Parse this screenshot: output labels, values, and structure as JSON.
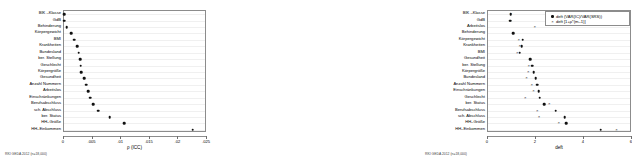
{
  "figure": {
    "source_note_left": "RKI GEDA 2012 (n=18,000)",
    "source_note_right": "RKI GEDA 2012 (n=18,000)"
  },
  "chart_data": [
    {
      "type": "scatter",
      "panel": "left",
      "title": "",
      "xlabel": "ρ (ICC)",
      "ylabel": "",
      "xlim": [
        0,
        0.025
      ],
      "xticks": [
        0,
        0.005,
        0.01,
        0.015,
        0.02,
        0.025
      ],
      "xticklabels": [
        "0",
        ".005",
        ".01",
        ".015",
        ".02",
        ".025"
      ],
      "grid": true,
      "legend": "none",
      "categories": [
        "BIK –Klasse",
        "GdB",
        "Behinderung",
        "Körpergewicht",
        "BMI",
        "Krankheiten",
        "Bundesland",
        "ber. Stellung",
        "Geschlecht",
        "Körpergröße",
        "Gesundheit",
        "Anzahl Nummern",
        "Arbeitslos",
        "Einschränkungen",
        "Berufsabschluss",
        "sch. Abschluss",
        "ber. Status",
        "HH–Größe",
        "HH–Einkommen"
      ],
      "series": [
        {
          "name": "ρ (ICC)",
          "marker": "circle",
          "values": [
            0.0,
            0.0,
            0.0005,
            0.0013,
            0.0018,
            0.0023,
            0.0026,
            0.0028,
            0.0029,
            0.003,
            0.0035,
            0.0039,
            0.0042,
            0.0046,
            0.0051,
            0.006,
            0.008,
            0.0105,
            0.0225
          ]
        }
      ]
    },
    {
      "type": "scatter",
      "panel": "right",
      "title": "",
      "xlabel": "deft",
      "ylabel": "",
      "xlim": [
        0,
        6
      ],
      "xticks": [
        0,
        2,
        4,
        6
      ],
      "xticklabels": [
        "0",
        "2",
        "4",
        "6"
      ],
      "grid": true,
      "legend": "upper right",
      "legend_entries": [
        "deft (VAR(IC)/VAR(SRS))",
        "deft [1+ρ*(m–1)]"
      ],
      "categories": [
        "BIK –Klasse",
        "GdB",
        "Arbeitslos",
        "Behinderung",
        "Körpergewicht",
        "Krankheiten",
        "BMI",
        "Gesundheit",
        "ber. Stellung",
        "Körpergröße",
        "Bundesland",
        "Anzahl Nummern",
        "Einschränkungen",
        "Geschlecht",
        "ber. Status",
        "Berufsabschluss",
        "sch. Abschluss",
        "HH–Größe",
        "HH–Einkommen"
      ],
      "series": [
        {
          "name": "deft (VAR(IC)/VAR(SRS))",
          "marker": "circle",
          "values": [
            0.95,
            0.92,
            null,
            1.05,
            1.45,
            1.4,
            1.32,
            1.75,
            1.85,
            1.9,
            1.98,
            2.05,
            2.12,
            2.15,
            2.35,
            2.82,
            3.2,
            3.25,
            4.7
          ]
        },
        {
          "name": "deft [1+ρ*(m–1)]",
          "marker": "x",
          "values": [
            0.95,
            0.92,
            1.95,
            null,
            1.28,
            1.32,
            1.22,
            1.75,
            1.7,
            1.68,
            1.6,
            1.82,
            1.9,
            1.55,
            2.55,
            2.05,
            2.12,
            2.95,
            5.35
          ]
        }
      ]
    }
  ]
}
